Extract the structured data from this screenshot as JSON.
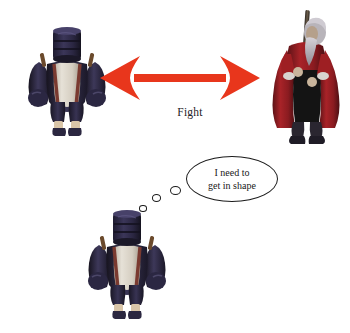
{
  "scene": {
    "width": 350,
    "height": 333,
    "background_color": "#ffffff",
    "description": "Meme-style comparison diagram of video game characters"
  },
  "arrow": {
    "name": "double-headed-arrow",
    "label": "Fight",
    "color": "#e8361c",
    "direction": "bidirectional"
  },
  "thought_bubble": {
    "line1": "I need to",
    "line2": "get in shape",
    "outline_color": "#1b1b1b",
    "fill_color": "#ffffff",
    "tail_dots": 3
  },
  "characters": [
    {
      "id": "fighter-top-left",
      "name": "Stout armored fighter",
      "position": "top-left",
      "helmet_color": "#2e2a46",
      "armor_color": "#3a3552",
      "tabard_color": "#d9d3c8",
      "belt_color": "#7a3a30",
      "sock_color": "#d9c5a8",
      "boot_color": "#2b2740"
    },
    {
      "id": "warrior-right",
      "name": "Bearded warrior with staff",
      "position": "top-right",
      "robe_color": "#9e1f23",
      "robe_dark_color": "#5c1216",
      "beard_color": "#b9b5bb",
      "staff_color": "#4a4036",
      "inner_color": "#1a1a1a",
      "boot_color": "#2a2630"
    },
    {
      "id": "fighter-bottom",
      "name": "Stout armored fighter",
      "position": "bottom-center",
      "helmet_color": "#2e2a46",
      "armor_color": "#3a3552",
      "tabard_color": "#d9d3c8",
      "belt_color": "#7a3a30",
      "sock_color": "#d9c5a8",
      "boot_color": "#2b2740"
    }
  ]
}
